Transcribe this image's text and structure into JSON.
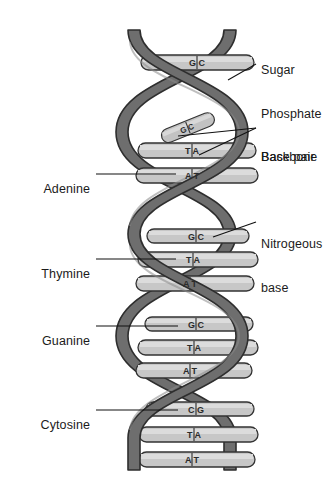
{
  "figure": {
    "type": "biology-diagram",
    "background_color": "#ffffff",
    "ink_color": "#1b1b1b",
    "backbone_color": "#6e6e6e",
    "backbone_shadow_color": "#5a5a5a",
    "rung_color": "#b9b9b9",
    "rung_light_color": "#d2d2d2",
    "rung_outline_color": "#3a3a3a"
  },
  "labels": {
    "right": [
      {
        "id": "sugar-phosphate-backbone",
        "lines": [
          "Sugar",
          "Phosphate",
          "Backbone"
        ],
        "text": "Sugar Phosphate Backbone"
      },
      {
        "id": "base-pair",
        "lines": [
          "Base pair"
        ],
        "text": "Base pair"
      },
      {
        "id": "nitrogeous-base",
        "lines": [
          "Nitrogeous",
          "base"
        ],
        "text": "Nitrogeous base"
      }
    ],
    "left": [
      {
        "id": "adenine",
        "text": "Adenine"
      },
      {
        "id": "thymine",
        "text": "Thymine"
      },
      {
        "id": "guanine",
        "text": "Guanine"
      },
      {
        "id": "cytosine",
        "text": "Cytosine"
      }
    ]
  },
  "base_pairs": [
    {
      "index": 1,
      "left_base": "G",
      "right_base": "C",
      "text": "G  C",
      "y": 63
    },
    {
      "index": 2,
      "left_base": "G",
      "right_base": "C",
      "text": "G  C",
      "y": 128
    },
    {
      "index": 3,
      "left_base": "T",
      "right_base": "A",
      "text": "T  A",
      "y": 150
    },
    {
      "index": 4,
      "left_base": "A",
      "right_base": "T",
      "text": "A  T",
      "y": 175
    },
    {
      "index": 5,
      "left_base": "G",
      "right_base": "C",
      "text": "G  C",
      "y": 236
    },
    {
      "index": 6,
      "left_base": "T",
      "right_base": "A",
      "text": "T  A",
      "y": 259
    },
    {
      "index": 7,
      "left_base": "A",
      "right_base": "T",
      "text": "A  T",
      "y": 283
    },
    {
      "index": 8,
      "left_base": "G",
      "right_base": "C",
      "text": "G  C",
      "y": 324
    },
    {
      "index": 9,
      "left_base": "T",
      "right_base": "A",
      "text": "T  A",
      "y": 347
    },
    {
      "index": 10,
      "left_base": "A",
      "right_base": "T",
      "text": "A  T",
      "y": 370
    },
    {
      "index": 11,
      "left_base": "C",
      "right_base": "G",
      "text": "C  G",
      "y": 409
    },
    {
      "index": 12,
      "left_base": "T",
      "right_base": "A",
      "text": "T  A",
      "y": 434
    },
    {
      "index": 13,
      "left_base": "A",
      "right_base": "T",
      "text": "A  T",
      "y": 459
    }
  ]
}
